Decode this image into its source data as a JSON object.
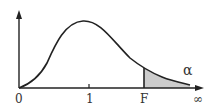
{
  "diagram": {
    "axis_labels": {
      "origin": "0",
      "one": "1",
      "critical": "F",
      "infinity": "∞"
    },
    "area_label": "α",
    "colors": {
      "line": "#222222",
      "shade": "#cccccc",
      "text": "#333333"
    }
  }
}
